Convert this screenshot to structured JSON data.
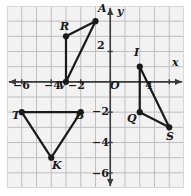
{
  "figure": {
    "name": "coordinate-plane-with-triangles",
    "background_color": "#ffffff",
    "plot_background_color": "#f2f2f2",
    "grid_color": "#bfbfbf",
    "axis_color": "#3a3a3a",
    "shape_color": "#1a1a1a"
  },
  "axes": {
    "x_axis_label": "x",
    "y_axis_label": "y",
    "origin_label": "O",
    "x_ticks": [
      {
        "label": "−6",
        "value": -6
      },
      {
        "label": "−4",
        "value": -4
      },
      {
        "label": "−2",
        "value": -2
      },
      {
        "label": "4",
        "value": 4
      }
    ],
    "y_ticks": [
      {
        "label": "2",
        "value": 2
      },
      {
        "label": "−2",
        "value": -2
      },
      {
        "label": "−4",
        "value": -4
      },
      {
        "label": "−6",
        "value": -6
      }
    ],
    "x_range": [
      -7,
      5
    ],
    "y_range": [
      -7,
      5
    ],
    "grid_step": 1
  },
  "chart_data": {
    "type": "scatter",
    "title": "",
    "xlabel": "x",
    "ylabel": "y",
    "xlim": [
      -7,
      5
    ],
    "ylim": [
      -7,
      5
    ],
    "grid": true,
    "legend": "none",
    "series": [
      {
        "name": "Triangle RAV",
        "closed": true,
        "points": [
          {
            "label": "R",
            "x": -3,
            "y": 3
          },
          {
            "label": "A",
            "x": -1,
            "y": 4
          },
          {
            "label": "V",
            "x": -3,
            "y": 0
          }
        ]
      },
      {
        "name": "Triangle IQS",
        "closed": true,
        "points": [
          {
            "label": "I",
            "x": 2,
            "y": 1
          },
          {
            "label": "Q",
            "x": 2,
            "y": -2
          },
          {
            "label": "S",
            "x": 4,
            "y": -3
          }
        ]
      },
      {
        "name": "Triangle TBK",
        "closed": true,
        "points": [
          {
            "label": "T",
            "x": -6,
            "y": -2
          },
          {
            "label": "B",
            "x": -2,
            "y": -2
          },
          {
            "label": "K",
            "x": -4,
            "y": -5
          }
        ]
      }
    ]
  },
  "vertex_labels": [
    {
      "text": "R",
      "left": 60,
      "top": 21
    },
    {
      "text": "A",
      "left": 98,
      "top": 3
    },
    {
      "text": "V",
      "left": 58,
      "top": 80
    },
    {
      "text": "I",
      "left": 134,
      "top": 47
    },
    {
      "text": "Q",
      "left": 127,
      "top": 113
    },
    {
      "text": "S",
      "left": 166,
      "top": 131
    },
    {
      "text": "T",
      "left": 12,
      "top": 110
    },
    {
      "text": "B",
      "left": 75,
      "top": 110
    },
    {
      "text": "K",
      "left": 52,
      "top": 160
    }
  ],
  "tick_label_positions": [
    {
      "text": "−6",
      "left": 13,
      "top": 80
    },
    {
      "text": "−4",
      "left": 44,
      "top": 80
    },
    {
      "text": "−2",
      "left": 68,
      "top": 80
    },
    {
      "text": "O",
      "left": 110,
      "top": 80
    },
    {
      "text": "4",
      "left": 145,
      "top": 80
    },
    {
      "text": "2",
      "left": 97,
      "top": 40
    },
    {
      "text": "−2",
      "left": 92,
      "top": 106
    },
    {
      "text": "−4",
      "left": 92,
      "top": 137
    },
    {
      "text": "−6",
      "left": 92,
      "top": 168
    },
    {
      "text": "x",
      "left": 172,
      "top": 57
    },
    {
      "text": "y",
      "left": 117,
      "top": 6
    }
  ]
}
